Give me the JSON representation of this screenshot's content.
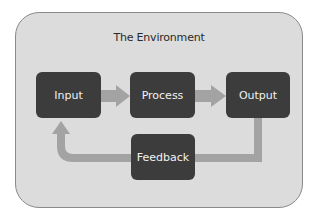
{
  "diagram": {
    "container": {
      "label": "The Environment"
    },
    "nodes": [
      {
        "id": "input",
        "label": "Input"
      },
      {
        "id": "process",
        "label": "Process"
      },
      {
        "id": "output",
        "label": "Output"
      },
      {
        "id": "feedback",
        "label": "Feedback"
      }
    ],
    "edges": [
      {
        "from": "input",
        "to": "process"
      },
      {
        "from": "process",
        "to": "output"
      },
      {
        "from": "output",
        "to": "feedback"
      },
      {
        "from": "feedback",
        "to": "input"
      }
    ],
    "colors": {
      "container_fill": "#dcdcdc",
      "container_border": "#8a8a8a",
      "node_fill": "#3c3c3c",
      "node_text": "#f2f2f2",
      "arrow": "#a3a3a3"
    }
  }
}
